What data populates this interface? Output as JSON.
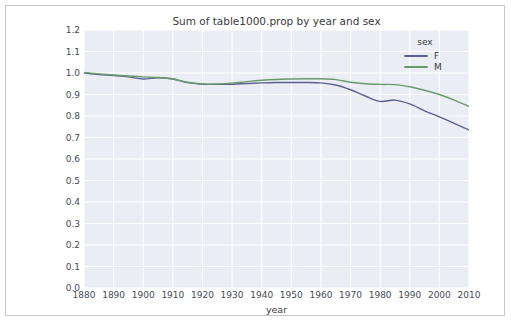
{
  "chart_data": {
    "type": "line",
    "title": "Sum of table1000.prop by year and sex",
    "xlabel": "year",
    "ylabel": "",
    "xlim": [
      1880,
      2010
    ],
    "ylim": [
      0.0,
      1.2
    ],
    "grid": true,
    "legend_title": "sex",
    "legend_position": "top-right-outside",
    "xticks": [
      "1880",
      "1890",
      "1900",
      "1910",
      "1920",
      "1930",
      "1940",
      "1950",
      "1960",
      "1970",
      "1980",
      "1990",
      "2000",
      "2010"
    ],
    "yticks": [
      "1.2",
      "1.1",
      "1.0",
      "0.9",
      "0.8",
      "0.7",
      "0.6",
      "0.5",
      "0.4",
      "0.3",
      "0.2",
      "0.1",
      "0.0"
    ],
    "x": [
      1880,
      1885,
      1890,
      1895,
      1900,
      1905,
      1910,
      1915,
      1920,
      1925,
      1930,
      1935,
      1940,
      1945,
      1950,
      1955,
      1960,
      1965,
      1970,
      1975,
      1980,
      1985,
      1990,
      1995,
      2000,
      2005,
      2010
    ],
    "series": [
      {
        "name": "F",
        "color": "#5b5f8f",
        "values": [
          1.0,
          0.993,
          0.988,
          0.982,
          0.972,
          0.978,
          0.972,
          0.955,
          0.948,
          0.947,
          0.948,
          0.951,
          0.954,
          0.956,
          0.956,
          0.956,
          0.954,
          0.944,
          0.922,
          0.893,
          0.868,
          0.874,
          0.856,
          0.824,
          0.796,
          0.766,
          0.735
        ]
      },
      {
        "name": "M",
        "color": "#6a9a6c",
        "values": [
          1.002,
          0.996,
          0.991,
          0.986,
          0.982,
          0.979,
          0.973,
          0.957,
          0.949,
          0.949,
          0.953,
          0.96,
          0.966,
          0.97,
          0.972,
          0.973,
          0.973,
          0.969,
          0.957,
          0.95,
          0.947,
          0.946,
          0.936,
          0.92,
          0.9,
          0.874,
          0.845
        ]
      }
    ]
  }
}
